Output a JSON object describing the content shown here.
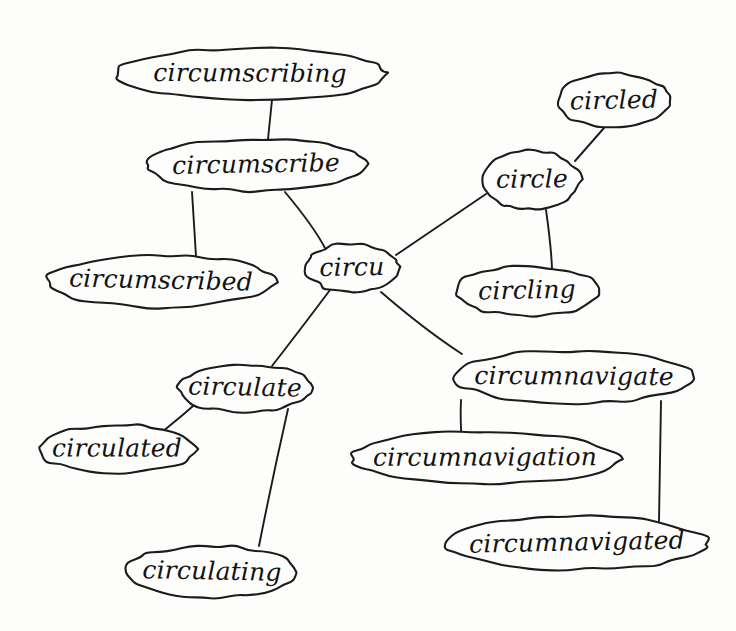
{
  "diagram": {
    "style": "hand-drawn pen sketch",
    "ink_color": "#1b1b1b",
    "background_color": "#fdfdfc",
    "node_count": 12,
    "edge_count": 11
  },
  "nodes": {
    "hub": {
      "label": "circu",
      "cx": 352,
      "cy": 268,
      "rx": 46,
      "ry": 25,
      "font_size": 25
    },
    "circumscribe": {
      "label": "circumscribe",
      "cx": 256,
      "cy": 165,
      "rx": 111,
      "ry": 26,
      "font_size": 25
    },
    "circumscribing": {
      "label": "circumscribing",
      "cx": 250,
      "cy": 74,
      "rx": 136,
      "ry": 26,
      "font_size": 25
    },
    "circumscribed": {
      "label": "circumscribed",
      "cx": 161,
      "cy": 281,
      "rx": 113,
      "ry": 26,
      "font_size": 25
    },
    "circle": {
      "label": "circle",
      "cx": 532,
      "cy": 180,
      "rx": 49,
      "ry": 30,
      "font_size": 25
    },
    "circled": {
      "label": "circled",
      "cx": 614,
      "cy": 101,
      "rx": 57,
      "ry": 27,
      "font_size": 25
    },
    "circling": {
      "label": "circling",
      "cx": 527,
      "cy": 291,
      "rx": 72,
      "ry": 25,
      "font_size": 25
    },
    "circulate": {
      "label": "circulate",
      "cx": 245,
      "cy": 388,
      "rx": 67,
      "ry": 24,
      "font_size": 25
    },
    "circulated": {
      "label": "circulated",
      "cx": 117,
      "cy": 449,
      "rx": 78,
      "ry": 24,
      "font_size": 25
    },
    "circulating": {
      "label": "circulating",
      "cx": 212,
      "cy": 572,
      "rx": 86,
      "ry": 26,
      "font_size": 25
    },
    "circumnavigate": {
      "label": "circumnavigate",
      "cx": 574,
      "cy": 377,
      "rx": 122,
      "ry": 26,
      "font_size": 25
    },
    "circumnavigation": {
      "label": "circumnavigation",
      "cx": 485,
      "cy": 458,
      "rx": 135,
      "ry": 26,
      "font_size": 25
    },
    "circumnavigated": {
      "label": "circumnavigated",
      "cx": 577,
      "cy": 543,
      "rx": 132,
      "ry": 27,
      "font_size": 25
    }
  },
  "edges": [
    {
      "from": "circumscribing",
      "to": "circumscribe",
      "path": "M 272 100 L 268 139"
    },
    {
      "from": "circumscribe",
      "to": "circumscribed",
      "path": "M 192 192 L 196 256"
    },
    {
      "from": "circumscribe",
      "to": "hub",
      "path": "M 285 192 Q 315 228 326 250"
    },
    {
      "from": "hub",
      "to": "circle",
      "path": "M 396 255 L 486 194"
    },
    {
      "from": "circle",
      "to": "circled",
      "path": "M 575 161 L 604 128"
    },
    {
      "from": "circle",
      "to": "circling",
      "path": "M 546 210 Q 551 245 552 268"
    },
    {
      "from": "hub",
      "to": "circulate",
      "path": "M 330 290 Q 300 330 272 366"
    },
    {
      "from": "circulate",
      "to": "circulated",
      "path": "M 200 400 Q 182 416 162 432"
    },
    {
      "from": "circulate",
      "to": "circulating",
      "path": "M 288 409 Q 272 480 259 546"
    },
    {
      "from": "hub",
      "to": "circumnavigate",
      "path": "M 381 292 Q 425 330 462 354"
    },
    {
      "from": "circumnavigate",
      "to": "circumnavigation",
      "path": "M 461 400 Q 460 420 462 444"
    },
    {
      "from": "circumnavigate",
      "to": "circumnavigated",
      "path": "M 661 401 Q 660 470 659 521"
    }
  ]
}
